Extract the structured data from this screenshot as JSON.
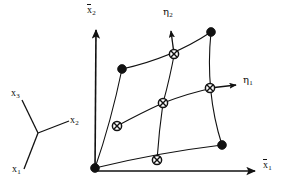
{
  "figure": {
    "type": "diagram",
    "background_color": "#ffffff",
    "ink_color": "#111111",
    "width": 286,
    "height": 189
  },
  "global_axes": {
    "origin": {
      "x": 95,
      "y": 171
    },
    "vertical_axis": {
      "name": "x2bar-axis",
      "label": "x",
      "subscript": "2",
      "overline": true,
      "label_x": 88,
      "label_y": 6,
      "tip": {
        "x": 96,
        "y": 27
      }
    },
    "horizontal_axis": {
      "name": "x1bar-axis",
      "label": "x",
      "subscript": "1",
      "overline": true,
      "label_x": 264,
      "label_y": 162,
      "tip": {
        "x": 258,
        "y": 171
      }
    }
  },
  "reference_triad": {
    "name": "cartesian-triad",
    "center": {
      "x": 38,
      "y": 133
    },
    "arms": [
      {
        "name": "x3-arm",
        "label": "x",
        "subscript": "3",
        "end_x": 22,
        "end_y": 100,
        "label_x": 12,
        "label_y": 88
      },
      {
        "name": "x2-arm",
        "label": "x",
        "subscript": "2",
        "end_x": 69,
        "end_y": 121,
        "label_x": 71,
        "label_y": 117
      },
      {
        "name": "x1-arm",
        "label": "x",
        "subscript": "1",
        "end_x": 24,
        "end_y": 169,
        "label_x": 13,
        "label_y": 167
      }
    ]
  },
  "natural_axes": [
    {
      "name": "eta2-axis",
      "label": "η",
      "subscript": "2",
      "from": {
        "x": 174,
        "y": 54
      },
      "to": {
        "x": 171,
        "y": 29
      },
      "label_x": 164,
      "label_y": 8
    },
    {
      "name": "eta1-axis",
      "label": "η",
      "subscript": "1",
      "from": {
        "x": 210,
        "y": 88
      },
      "to": {
        "x": 239,
        "y": 85
      },
      "label_x": 244,
      "label_y": 76
    }
  ],
  "element": {
    "name": "nine-node-quadrilateral",
    "corner_nodes": [
      {
        "id": "node-1",
        "x": 95,
        "y": 168,
        "role": "corner"
      },
      {
        "id": "node-2",
        "x": 222,
        "y": 145,
        "role": "corner"
      },
      {
        "id": "node-3",
        "x": 211,
        "y": 32,
        "role": "corner"
      },
      {
        "id": "node-4",
        "x": 122,
        "y": 69,
        "role": "corner"
      }
    ],
    "midside_nodes": [
      {
        "id": "node-5",
        "x": 157,
        "y": 160,
        "role": "midside-bottom"
      },
      {
        "id": "node-6",
        "x": 210,
        "y": 88,
        "role": "midside-right"
      },
      {
        "id": "node-7",
        "x": 174,
        "y": 54,
        "role": "midside-top"
      },
      {
        "id": "node-8",
        "x": 117,
        "y": 126,
        "role": "midside-left"
      }
    ],
    "center_node": {
      "id": "node-9",
      "x": 163,
      "y": 103,
      "role": "center"
    },
    "edges": [
      {
        "id": "edge-bottom",
        "path": "M 95 168 Q 156 153 222 145"
      },
      {
        "id": "edge-right",
        "path": "M 222 145 Q 206 90 211 32"
      },
      {
        "id": "edge-top",
        "path": "M 211 32 Q 172 59 122 69"
      },
      {
        "id": "edge-left",
        "path": "M 122 69 Q 112 124 95 168"
      }
    ],
    "interior_curves": [
      {
        "id": "curve-eta1-iso",
        "path": "M 117 126 Q 141 113 163 103 Q 188 92 210 88"
      },
      {
        "id": "curve-eta2-iso",
        "path": "M 157 160 Q 160 130 163 103 Q 170 77 174 54"
      }
    ],
    "node_marker_radius_corner": 4.2,
    "node_marker_radius_midside": 4.6
  }
}
